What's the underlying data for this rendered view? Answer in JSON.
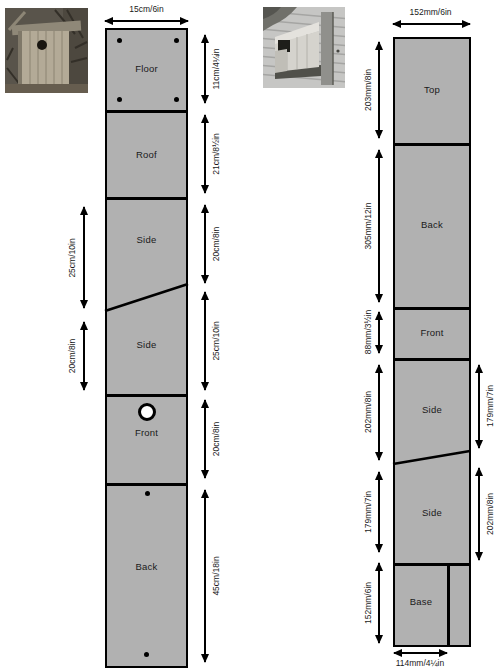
{
  "colors": {
    "background": "#ffffff",
    "plank_fill": "#b1b1b1",
    "outline": "#000000"
  },
  "photos": {
    "left": {
      "name": "round-hole-nest-box-photo"
    },
    "right": {
      "name": "open-front-nest-box-photo"
    }
  },
  "left_plank": {
    "width_dim": "15cm/6in",
    "sections": [
      "Floor",
      "Roof",
      "Side",
      "Side",
      "Front",
      "Back"
    ],
    "right_dims": [
      "11cm/4¼in",
      "21cm/8½in",
      "20cm/8in",
      "25cm/10in",
      "20cm/8in",
      "45cm/18in"
    ],
    "left_dims": [
      "25cm/10in",
      "20cm/8in"
    ]
  },
  "right_plank": {
    "width_dim": "152mm/6in",
    "base_width_dim": "114mm/4¼in",
    "sections": [
      "Top",
      "Back",
      "Front",
      "Side",
      "Side",
      "Base"
    ],
    "left_dims": [
      "203mm/8in",
      "305mm/12in",
      "88mm/3½in",
      "202mm/8in",
      "179mm/7in",
      "152mm/6in"
    ],
    "right_dims": [
      "179mm/7in",
      "202mm/8in"
    ]
  }
}
